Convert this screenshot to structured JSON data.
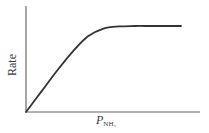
{
  "chart_data": {
    "type": "line",
    "title": "",
    "xlabel": "P_NH3",
    "xlabel_main": "P",
    "xlabel_sub": "NH₃",
    "ylabel": "Rate",
    "grid": false,
    "legend": null,
    "ticks": false,
    "series": [
      {
        "name": "Rate",
        "x": [
          0,
          0.1,
          0.2,
          0.3,
          0.4,
          0.5,
          0.6,
          0.7,
          0.8,
          0.9,
          1.0
        ],
        "y": [
          0,
          0.24,
          0.48,
          0.7,
          0.88,
          0.97,
          0.995,
          1.0,
          1.0,
          1.0,
          1.0
        ]
      }
    ],
    "xlim": [
      0,
      1.1
    ],
    "ylim": [
      0,
      1.25
    ],
    "colors": {
      "axis": "#555555",
      "curve": "#333333"
    }
  }
}
